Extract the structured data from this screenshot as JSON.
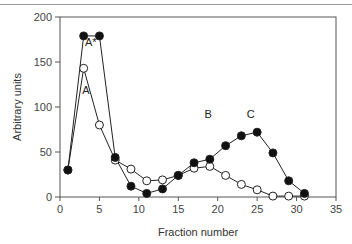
{
  "chart_data": {
    "type": "line",
    "title": "",
    "xlabel": "Fraction number",
    "ylabel": "Arbitrary units",
    "xlim": [
      0,
      35
    ],
    "ylim": [
      0,
      200
    ],
    "xticks": [
      0,
      5,
      10,
      15,
      20,
      25,
      30,
      35
    ],
    "yticks": [
      0,
      50,
      100,
      150,
      200
    ],
    "grid": false,
    "legend": null,
    "series": [
      {
        "name": "filled",
        "marker": "filled-circle",
        "x": [
          1,
          3,
          5,
          7,
          9,
          11,
          13,
          15,
          17,
          19,
          21,
          23,
          25,
          27,
          29,
          31
        ],
        "values": [
          30,
          179,
          179,
          44,
          12,
          4,
          9,
          24,
          38,
          42,
          57,
          68,
          72,
          49,
          18,
          4
        ]
      },
      {
        "name": "open",
        "marker": "open-circle",
        "x": [
          1,
          3,
          5,
          7,
          9,
          11,
          13,
          15,
          17,
          19,
          21,
          23,
          25,
          27,
          29,
          31
        ],
        "values": [
          30,
          143,
          80,
          41,
          31,
          18,
          19,
          24,
          32,
          34,
          24,
          14,
          8,
          1,
          1,
          1
        ]
      }
    ],
    "annotations": [
      {
        "text": "A*",
        "x": 3.9,
        "y": 168
      },
      {
        "text": "A",
        "x": 3.3,
        "y": 114
      },
      {
        "text": "B",
        "x": 18.8,
        "y": 88
      },
      {
        "text": "C",
        "x": 24.2,
        "y": 88
      }
    ]
  }
}
